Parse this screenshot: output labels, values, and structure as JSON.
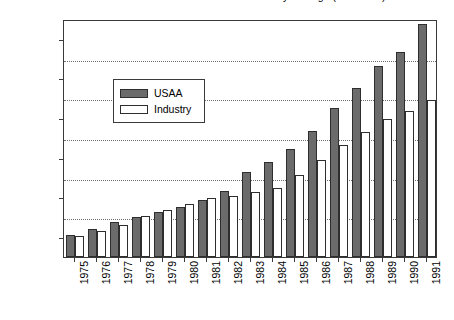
{
  "chart_data": {
    "type": "bar",
    "title": "Exhibit 2.  Premiums Written: USAA vs. Industry Average (in millions)",
    "xlabel": "",
    "ylabel": "",
    "ylim": [
      0,
      1200
    ],
    "ytick_step": 200,
    "ytick_labels": [
      "0.00",
      "200.00",
      "400.00",
      "600.00",
      "800.00",
      "1000.00",
      "1200.00"
    ],
    "yticks": [
      0,
      200,
      400,
      600,
      800,
      1000,
      1200
    ],
    "grid": true,
    "grid_axis": "y",
    "grid_style": "dotted",
    "legend_position": "upper-left-inside",
    "categories": [
      "1975",
      "1976",
      "1977",
      "1978",
      "1979",
      "1980",
      "1981",
      "1982",
      "1983",
      "1984",
      "1985",
      "1986",
      "1987",
      "1988",
      "1989",
      "1990",
      "1991"
    ],
    "series": [
      {
        "name": "USAA",
        "color": "#6b6b6b",
        "values": [
          110,
          140,
          175,
          200,
          225,
          250,
          285,
          335,
          430,
          480,
          545,
          635,
          750,
          850,
          965,
          1035,
          1175
        ]
      },
      {
        "name": "Industry",
        "color": "#ffffff",
        "values": [
          105,
          130,
          160,
          205,
          235,
          265,
          300,
          310,
          330,
          350,
          415,
          490,
          565,
          630,
          695,
          735,
          790
        ]
      }
    ]
  },
  "legend": {
    "items": [
      {
        "label": "USAA",
        "swatch": "usaa"
      },
      {
        "label": "Industry",
        "swatch": "industry"
      }
    ]
  }
}
